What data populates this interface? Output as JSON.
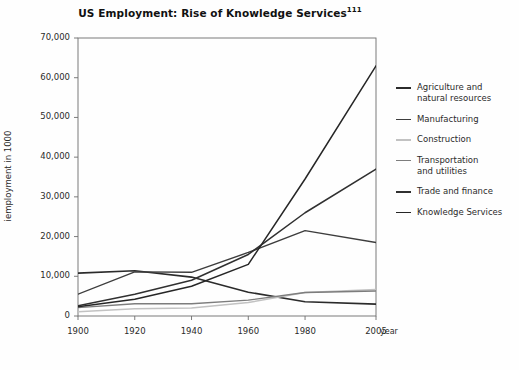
{
  "figure": {
    "background": "#fefefe",
    "frame_color": "#6e6e6e"
  },
  "chart_data": {
    "type": "line",
    "title": "US Employment: Rise of Knowledge Services",
    "title_superscript": "111",
    "xlabel": "",
    "x_unit_label": "year",
    "ylabel": "iemployment in 1000",
    "x": [
      1900,
      1920,
      1940,
      1960,
      1980,
      2005
    ],
    "xticklabels": [
      "1900",
      "1920",
      "1940",
      "1960",
      "1980",
      "2005"
    ],
    "xlim": [
      1900,
      2005
    ],
    "ylim": [
      0,
      70000
    ],
    "yticks": [
      0,
      10000,
      20000,
      30000,
      40000,
      50000,
      60000,
      70000
    ],
    "yticklabels": [
      "0",
      "10,000",
      "20,000",
      "30,000",
      "40,000",
      "50,000",
      "60,000",
      "70,000"
    ],
    "grid": false,
    "legend_position": "right",
    "series": [
      {
        "name": "Agriculture and\nnatural resources",
        "color": "#2b2b2b",
        "width": 1.6,
        "values": [
          10800,
          11400,
          9800,
          6000,
          3600,
          3000
        ]
      },
      {
        "name": "Manufacturing",
        "color": "#3d3d3d",
        "width": 1.4,
        "values": [
          5500,
          11100,
          11000,
          16000,
          21500,
          18500
        ]
      },
      {
        "name": "Construction",
        "color": "#c2c2c2",
        "width": 1.5,
        "values": [
          1100,
          1800,
          2000,
          3400,
          5900,
          6700
        ]
      },
      {
        "name": "Transportation\nand utilities",
        "color": "#7d7d7d",
        "width": 1.4,
        "values": [
          2100,
          3100,
          3100,
          4000,
          5900,
          6300
        ]
      },
      {
        "name": "Trade and finance",
        "color": "#303030",
        "width": 1.5,
        "values": [
          2600,
          5500,
          9000,
          15500,
          26000,
          37000
        ]
      },
      {
        "name": "Knowledge Services",
        "color": "#262626",
        "width": 1.5,
        "values": [
          2300,
          4200,
          7500,
          13000,
          34500,
          63000
        ]
      }
    ]
  }
}
